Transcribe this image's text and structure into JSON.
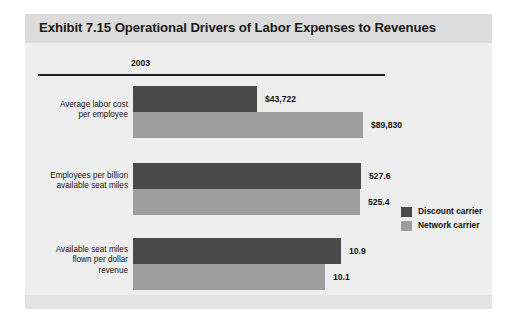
{
  "title": "Exhibit 7.15 Operational Drivers of Labor Expenses to Revenues",
  "year_header": "2003",
  "legend": [
    {
      "label": "Discount carrier",
      "color": "#4a4a4a"
    },
    {
      "label": "Network carrier",
      "color": "#9e9e9e"
    }
  ],
  "groups": [
    {
      "label": "Average labor cost\nper employee",
      "discount_value": "$43,722",
      "network_value": "$89,830"
    },
    {
      "label": "Employees per billion\navailable seat miles",
      "discount_value": "527.6",
      "network_value": "525.4"
    },
    {
      "label": "Available seat miles\nflown per dollar\nrevenue",
      "discount_value": "10.9",
      "network_value": "10.1"
    }
  ],
  "chart_data": {
    "type": "bar",
    "orientation": "horizontal",
    "title": "Exhibit 7.15 Operational Drivers of Labor Expenses to Revenues",
    "xlabel": "",
    "ylabel": "",
    "grid": false,
    "legend_position": "right",
    "column_header": "2003",
    "categories": [
      "Average labor cost per employee",
      "Employees per billion available seat miles",
      "Available seat miles flown per dollar revenue"
    ],
    "series": [
      {
        "name": "Discount carrier",
        "color": "#4a4a4a",
        "values": [
          43722,
          527.6,
          10.9
        ],
        "labels": [
          "$43,722",
          "527.6",
          "10.9"
        ]
      },
      {
        "name": "Network carrier",
        "color": "#9e9e9e",
        "values": [
          89830,
          525.4,
          10.1
        ],
        "labels": [
          "$89,830",
          "525.4",
          "10.1"
        ]
      }
    ],
    "bar_pixel_widths": {
      "discount": [
        124,
        228,
        208
      ],
      "network": [
        230,
        227,
        192
      ]
    }
  }
}
